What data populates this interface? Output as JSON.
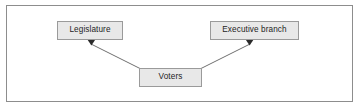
{
  "diagram": {
    "type": "flow-diagram",
    "title": "",
    "frame": {
      "border_color": "#8d8d8d",
      "background_color": "#ffffff"
    },
    "node_style": {
      "fill_color": "#e8e8e8",
      "border_color": "#9a9a9a",
      "text_color": "#1d1d1d"
    },
    "edge_style": {
      "line_color": "#6f6f6f",
      "arrowhead": "filled-triangle"
    },
    "nodes": [
      {
        "id": "legislature",
        "label": "Legislature"
      },
      {
        "id": "executive-branch",
        "label": "Executive branch"
      },
      {
        "id": "voters",
        "label": "Voters"
      }
    ],
    "edges": [
      {
        "from": "voters",
        "to": "legislature",
        "directed": true
      },
      {
        "from": "voters",
        "to": "executive-branch",
        "directed": true
      }
    ]
  }
}
